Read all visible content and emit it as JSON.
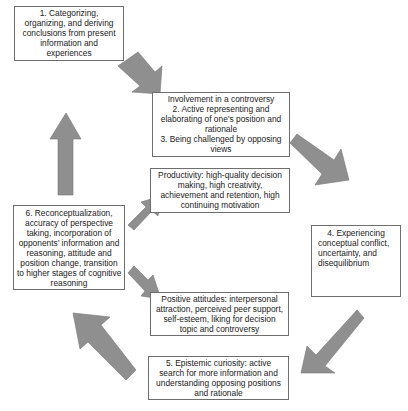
{
  "diagram": {
    "type": "cycle-flow",
    "colors": {
      "arrow_fill": "#8f8f8f",
      "box_border": "#6e6e6e",
      "text": "#222222",
      "background": "#ffffff"
    },
    "boxes": [
      {
        "id": "step1",
        "lines": [
          "1. Categorizing,",
          "organizing, and deriving",
          "conclusions from present",
          "information and",
          "experiences"
        ]
      },
      {
        "id": "step2-3",
        "lines": [
          "Involvement in a controversy",
          "2. Active representing and",
          "elaborating of one’s position and",
          "rationale",
          "3. Being challenged by opposing",
          "views"
        ]
      },
      {
        "id": "productivity",
        "lines": [
          "Productivity: high-quality decision",
          "making, high creativity,",
          "achievement and retention, high",
          "continuing motivation"
        ]
      },
      {
        "id": "step4",
        "lines": [
          "4. Experiencing",
          "conceptual conflict,",
          "uncertainty, and",
          "disequilibrium"
        ]
      },
      {
        "id": "step6",
        "lines": [
          "6. Reconceptualization,",
          "accuracy of perspective",
          "taking, incorporation of",
          "opponents’ information and",
          "reasoning, attitude and",
          "position change, transition",
          "to higher stages of cognitive",
          "reasoning"
        ]
      },
      {
        "id": "positive-attitudes",
        "lines": [
          "Positive attitudes: interpersonal",
          "attraction, perceived peer support,",
          "self-esteem, liking for decision",
          "topic and controversy"
        ]
      },
      {
        "id": "step5",
        "lines": [
          "5. Epistemic curiosity: active",
          "search for more information and",
          "understanding opposing positions",
          "and rationale"
        ]
      }
    ],
    "arrows": [
      {
        "from": "step1",
        "to": "step2-3",
        "direction": "down-right"
      },
      {
        "from": "step2-3",
        "to": "step4",
        "direction": "down-right"
      },
      {
        "from": "step4",
        "to": "step5",
        "direction": "down-left"
      },
      {
        "from": "step5",
        "to": "step6",
        "direction": "up-left"
      },
      {
        "from": "step6",
        "to": "step1",
        "direction": "up"
      },
      {
        "from": "step6",
        "to": "productivity",
        "direction": "up-right"
      },
      {
        "from": "step6",
        "to": "positive-attitudes",
        "direction": "down-right"
      }
    ]
  }
}
